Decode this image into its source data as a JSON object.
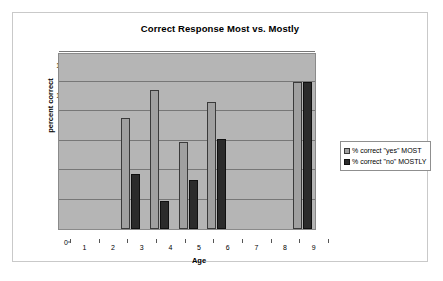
{
  "chart_data": {
    "type": "bar",
    "title": "Correct Response Most vs. Mostly",
    "xlabel": "Age",
    "ylabel": "percent correct",
    "categories": [
      "1",
      "2",
      "3",
      "4",
      "5",
      "6",
      "7",
      "8",
      "9"
    ],
    "series": [
      {
        "name": "% correct \"yes\" MOST",
        "color": "#a0a0a0",
        "values": [
          0,
          0,
          75,
          94,
          59,
          86,
          0,
          0,
          100
        ]
      },
      {
        "name": "% correct \"no\" MOSTLY",
        "color": "#2b2b2b",
        "values": [
          0,
          0,
          37,
          19,
          33,
          61,
          0,
          0,
          100
        ]
      }
    ],
    "ylim": [
      0,
      120
    ],
    "yticks": [
      0,
      20,
      40,
      60,
      80,
      100,
      120
    ],
    "ytick_labels": [
      "0",
      "20",
      "40",
      "60",
      "80",
      "100",
      "120"
    ],
    "grid": true,
    "legend_position": "right",
    "plot_background": "#b5b5b5"
  }
}
